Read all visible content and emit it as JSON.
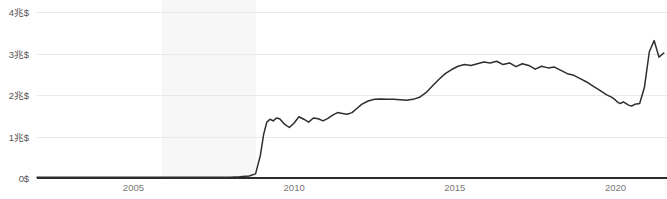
{
  "chart_data": {
    "type": "line",
    "title": "",
    "subtitle": "",
    "xlabel": "",
    "ylabel": "",
    "xlim": [
      2002.0,
      2021.6
    ],
    "ylim": [
      0,
      4.3
    ],
    "y_unit_suffix": "兆$",
    "grid": true,
    "legend": null,
    "y_ticks": [
      {
        "value": 0,
        "label": "0$"
      },
      {
        "value": 1,
        "label": "1兆$"
      },
      {
        "value": 2,
        "label": "2兆$"
      },
      {
        "value": 3,
        "label": "3兆$"
      },
      {
        "value": 4,
        "label": "4兆$"
      }
    ],
    "x_ticks": [
      {
        "value": 2005,
        "label": "2005"
      },
      {
        "value": 2010,
        "label": "2010"
      },
      {
        "value": 2015,
        "label": "2015"
      },
      {
        "value": 2020,
        "label": "2020"
      }
    ],
    "shaded_regions": [
      {
        "name": "recession-band",
        "x_start": 2005.9,
        "x_end": 2008.8,
        "color": "#f7f7f7"
      }
    ],
    "series": [
      {
        "name": "total",
        "color": "#2e2e2e",
        "x": [
          2002.0,
          2002.5,
          2003.0,
          2003.5,
          2004.0,
          2004.5,
          2005.0,
          2005.5,
          2006.0,
          2006.5,
          2007.0,
          2007.5,
          2008.0,
          2008.3,
          2008.6,
          2008.8,
          2008.95,
          2009.05,
          2009.15,
          2009.25,
          2009.35,
          2009.45,
          2009.55,
          2009.7,
          2009.85,
          2010.0,
          2010.15,
          2010.3,
          2010.45,
          2010.6,
          2010.75,
          2010.9,
          2011.05,
          2011.2,
          2011.35,
          2011.5,
          2011.65,
          2011.8,
          2011.95,
          2012.1,
          2012.3,
          2012.5,
          2012.7,
          2012.9,
          2013.1,
          2013.3,
          2013.5,
          2013.7,
          2013.9,
          2014.1,
          2014.3,
          2014.5,
          2014.7,
          2014.9,
          2015.1,
          2015.3,
          2015.5,
          2015.7,
          2015.9,
          2016.1,
          2016.3,
          2016.5,
          2016.7,
          2016.9,
          2017.1,
          2017.3,
          2017.5,
          2017.7,
          2017.9,
          2018.1,
          2018.3,
          2018.5,
          2018.7,
          2018.9,
          2019.1,
          2019.3,
          2019.5,
          2019.7,
          2019.9,
          2020.0,
          2020.08,
          2020.16,
          2020.24,
          2020.32,
          2020.4,
          2020.5,
          2020.6,
          2020.75,
          2020.9,
          2021.05,
          2021.2,
          2021.35,
          2021.5
        ],
        "y": [
          0.02,
          0.02,
          0.02,
          0.02,
          0.02,
          0.02,
          0.02,
          0.02,
          0.02,
          0.02,
          0.02,
          0.02,
          0.02,
          0.03,
          0.05,
          0.1,
          0.55,
          1.05,
          1.35,
          1.42,
          1.38,
          1.45,
          1.43,
          1.3,
          1.22,
          1.33,
          1.48,
          1.42,
          1.35,
          1.45,
          1.43,
          1.38,
          1.44,
          1.52,
          1.58,
          1.56,
          1.54,
          1.58,
          1.68,
          1.78,
          1.86,
          1.9,
          1.91,
          1.9,
          1.9,
          1.89,
          1.88,
          1.9,
          1.95,
          2.06,
          2.22,
          2.38,
          2.52,
          2.62,
          2.7,
          2.74,
          2.72,
          2.76,
          2.8,
          2.78,
          2.82,
          2.74,
          2.78,
          2.69,
          2.76,
          2.72,
          2.63,
          2.7,
          2.66,
          2.68,
          2.6,
          2.52,
          2.48,
          2.4,
          2.32,
          2.22,
          2.12,
          2.02,
          1.94,
          1.88,
          1.82,
          1.8,
          1.84,
          1.8,
          1.76,
          1.74,
          1.78,
          1.8,
          2.2,
          3.05,
          3.32,
          2.92,
          3.02
        ]
      }
    ]
  }
}
